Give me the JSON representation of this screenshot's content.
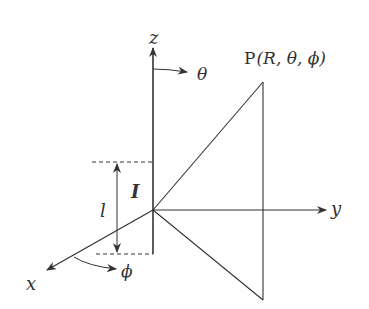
{
  "diagram": {
    "axes": {
      "z_label": "z",
      "y_label": "y",
      "x_label": "x"
    },
    "angles": {
      "theta_label": "θ",
      "phi_label": "ϕ"
    },
    "point": {
      "prefix": "P",
      "coords": "(R, θ, ϕ)"
    },
    "current": {
      "label": "I",
      "length_label": "l"
    },
    "colors": {
      "line": "#333333",
      "background": "#ffffff"
    }
  }
}
